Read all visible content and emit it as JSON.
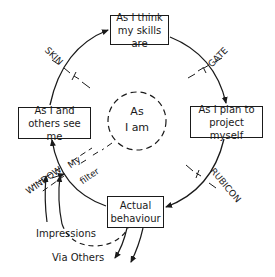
{
  "diagram": {
    "nodes": {
      "top": {
        "line1": "As I think",
        "line2": "my skills are"
      },
      "right": {
        "line1": "As I plan  to",
        "line2": "project myself"
      },
      "bottom": {
        "line1": "Actual",
        "line2": "behaviour"
      },
      "left": {
        "line1": "As I and",
        "line2": "others see me"
      },
      "center": {
        "line1": "As",
        "line2": "I am"
      }
    },
    "boundaries": {
      "skin": "SKIN",
      "gate": "GATE",
      "rubicon": "RUBICON",
      "window": "WINDOW",
      "filter_line1": "My",
      "filter_line2": "filter"
    },
    "annotations": {
      "impressions": "Impressions",
      "via_others": "Via Others"
    }
  }
}
